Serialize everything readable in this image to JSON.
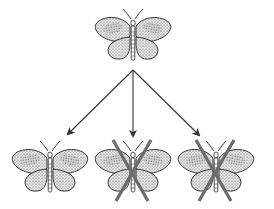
{
  "diagram": {
    "colors": {
      "background": "#ffffff",
      "outline": "#222222",
      "wing_fill": "#e4e4e4",
      "stipple": "#555555",
      "arrow": "#333333",
      "cross": "#6b6b6b"
    },
    "parent": {
      "cx": 133,
      "cy": 36,
      "scale": 1.0
    },
    "arrow_origin": {
      "x": 133,
      "y": 70
    },
    "offspring": [
      {
        "cx": 50,
        "cy": 168,
        "crossed": false
      },
      {
        "cx": 133,
        "cy": 168,
        "crossed": true
      },
      {
        "cx": 216,
        "cy": 168,
        "crossed": true
      }
    ]
  }
}
